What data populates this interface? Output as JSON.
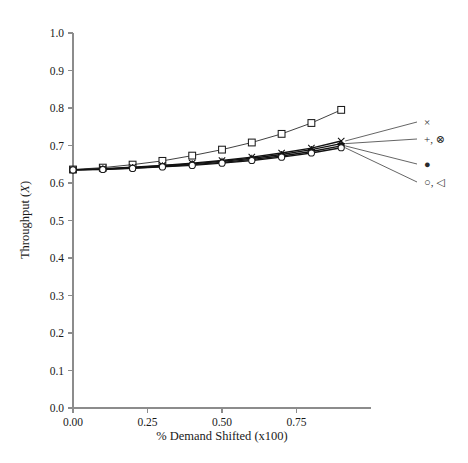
{
  "chart_data": {
    "type": "line",
    "title": "",
    "xlabel": "% Demand Shifted (x100)",
    "ylabel": "Throughput (X)",
    "ylabel_text": "Throughput (",
    "ylabel_italic": "X",
    "ylabel_close": ")",
    "xlim": [
      0.0,
      1.0
    ],
    "ylim": [
      0.0,
      1.0
    ],
    "grid": false,
    "legend_position": "right-outside",
    "x": [
      0.0,
      0.1,
      0.2,
      0.3,
      0.4,
      0.5,
      0.6,
      0.7,
      0.8,
      0.9
    ],
    "xticks": [
      0.0,
      0.25,
      0.5,
      0.75
    ],
    "xticklabels": [
      "0.00",
      "0.25",
      "0.50",
      "0.75"
    ],
    "yticks": [
      0.0,
      0.1,
      0.2,
      0.3,
      0.4,
      0.5,
      0.6,
      0.7,
      0.8,
      0.9,
      1.0
    ],
    "yticklabels": [
      "0.0",
      "0.1",
      "0.2",
      "0.3",
      "0.4",
      "0.5",
      "0.6",
      "0.7",
      "0.8",
      "0.9",
      "1.0"
    ],
    "series": [
      {
        "name": "square-series",
        "marker": "square-open",
        "legend": "",
        "values": [
          0.636,
          0.641,
          0.649,
          0.659,
          0.673,
          0.689,
          0.708,
          0.731,
          0.76,
          0.795
        ]
      },
      {
        "name": "cross-series",
        "marker": "x",
        "legend": "×",
        "values": [
          0.635,
          0.638,
          0.642,
          0.647,
          0.653,
          0.66,
          0.669,
          0.68,
          0.693,
          0.712
        ]
      },
      {
        "name": "plus-circled-series",
        "marker": "plus",
        "legend": "+, ⊗",
        "values": [
          0.635,
          0.637,
          0.641,
          0.646,
          0.651,
          0.658,
          0.666,
          0.676,
          0.689,
          0.705
        ]
      },
      {
        "name": "filled-circle-series",
        "marker": "circle-filled",
        "legend": "●",
        "values": [
          0.635,
          0.637,
          0.64,
          0.644,
          0.649,
          0.655,
          0.663,
          0.672,
          0.684,
          0.699
        ]
      },
      {
        "name": "open-circle-triangle-series",
        "marker": "circle-open",
        "legend": "○, ◁",
        "values": [
          0.635,
          0.636,
          0.639,
          0.643,
          0.647,
          0.653,
          0.66,
          0.669,
          0.68,
          0.694
        ]
      }
    ],
    "legend_entries": [
      {
        "label": "×",
        "anchor_value": 0.712
      },
      {
        "label": "+, ⊗",
        "anchor_value": 0.705
      },
      {
        "label": "●",
        "anchor_value": 0.699
      },
      {
        "label": "○, ◁",
        "anchor_value": 0.694
      }
    ],
    "colors": {
      "line": "#2b2b2b",
      "axis": "#8c8c8c",
      "text": "#1a1a1a",
      "background": "#ffffff"
    }
  }
}
